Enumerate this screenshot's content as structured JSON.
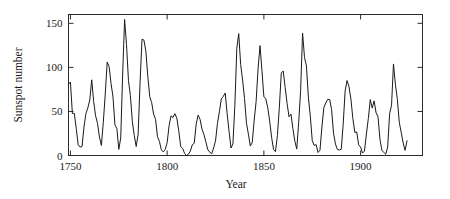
{
  "chart_data": {
    "type": "line",
    "title": "",
    "xlabel": "Year",
    "ylabel": "Sunspot number",
    "xlim": [
      1749,
      1932
    ],
    "ylim": [
      0,
      160
    ],
    "grid": false,
    "legend": null,
    "xticks": [
      1750,
      1800,
      1850,
      1900
    ],
    "xtick_labels": [
      "1750",
      "1800",
      "1850",
      "1900"
    ],
    "yticks": [
      0,
      50,
      100,
      150
    ],
    "ytick_labels": [
      "0",
      "50",
      "100",
      "150"
    ],
    "tick_direction": "in",
    "box": true,
    "line_color": "#1a1a1a",
    "background": "#ffffff",
    "series": [
      {
        "name": "Annual sunspot number",
        "x": [
          1749,
          1750,
          1751,
          1752,
          1753,
          1754,
          1755,
          1756,
          1757,
          1758,
          1759,
          1760,
          1761,
          1762,
          1763,
          1764,
          1765,
          1766,
          1767,
          1768,
          1769,
          1770,
          1771,
          1772,
          1773,
          1774,
          1775,
          1776,
          1777,
          1778,
          1779,
          1780,
          1781,
          1782,
          1783,
          1784,
          1785,
          1786,
          1787,
          1788,
          1789,
          1790,
          1791,
          1792,
          1793,
          1794,
          1795,
          1796,
          1797,
          1798,
          1799,
          1800,
          1801,
          1802,
          1803,
          1804,
          1805,
          1806,
          1807,
          1808,
          1809,
          1810,
          1811,
          1812,
          1813,
          1814,
          1815,
          1816,
          1817,
          1818,
          1819,
          1820,
          1821,
          1822,
          1823,
          1824,
          1825,
          1826,
          1827,
          1828,
          1829,
          1830,
          1831,
          1832,
          1833,
          1834,
          1835,
          1836,
          1837,
          1838,
          1839,
          1840,
          1841,
          1842,
          1843,
          1844,
          1845,
          1846,
          1847,
          1848,
          1849,
          1850,
          1851,
          1852,
          1853,
          1854,
          1855,
          1856,
          1857,
          1858,
          1859,
          1860,
          1861,
          1862,
          1863,
          1864,
          1865,
          1866,
          1867,
          1868,
          1869,
          1870,
          1871,
          1872,
          1873,
          1874,
          1875,
          1876,
          1877,
          1878,
          1879,
          1880,
          1881,
          1882,
          1883,
          1884,
          1885,
          1886,
          1887,
          1888,
          1889,
          1890,
          1891,
          1892,
          1893,
          1894,
          1895,
          1896,
          1897,
          1898,
          1899,
          1900,
          1901,
          1902,
          1903,
          1904,
          1905,
          1906,
          1907,
          1908,
          1909,
          1910,
          1911,
          1912,
          1913,
          1914,
          1915,
          1916,
          1917,
          1918,
          1919,
          1920,
          1921,
          1922,
          1923,
          1924
        ],
        "values": [
          80.9,
          83.4,
          47.7,
          47.8,
          30.7,
          12.2,
          9.6,
          10.2,
          32.4,
          47.6,
          54.0,
          62.9,
          85.9,
          61.2,
          45.1,
          36.4,
          20.9,
          11.4,
          37.8,
          69.8,
          106.1,
          100.8,
          81.6,
          66.5,
          34.8,
          30.6,
          7.0,
          19.8,
          92.5,
          154.4,
          125.9,
          84.8,
          68.1,
          38.5,
          22.8,
          10.2,
          24.1,
          82.9,
          132.0,
          130.9,
          118.1,
          89.9,
          66.6,
          60.0,
          46.9,
          41.0,
          21.3,
          16.0,
          6.4,
          4.1,
          6.8,
          14.5,
          34.0,
          45.0,
          43.1,
          47.5,
          42.2,
          28.1,
          10.1,
          8.1,
          2.5,
          0.0,
          1.4,
          5.0,
          12.2,
          13.9,
          35.4,
          45.8,
          41.1,
          30.1,
          23.9,
          15.6,
          6.6,
          4.0,
          1.8,
          8.5,
          16.6,
          36.3,
          49.6,
          64.2,
          67.0,
          70.9,
          47.8,
          27.5,
          8.5,
          13.2,
          56.9,
          121.5,
          138.3,
          103.2,
          85.7,
          64.6,
          36.7,
          24.2,
          10.7,
          15.0,
          40.1,
          61.5,
          98.5,
          124.7,
          96.3,
          66.6,
          64.5,
          54.1,
          39.0,
          20.6,
          6.7,
          4.3,
          22.7,
          54.8,
          93.8,
          95.8,
          77.2,
          59.1,
          44.0,
          47.0,
          30.5,
          16.3,
          7.3,
          37.6,
          74.0,
          139.0,
          111.2,
          101.6,
          66.2,
          44.7,
          17.0,
          11.3,
          12.4,
          3.4,
          6.0,
          32.3,
          54.3,
          59.7,
          63.7,
          63.5,
          52.2,
          25.4,
          13.1,
          6.8,
          6.3,
          7.1,
          35.6,
          73.0,
          85.1,
          78.0,
          64.0,
          41.8,
          26.2,
          26.7,
          12.1,
          9.5,
          2.7,
          5.0,
          24.4,
          42.0,
          63.5,
          53.8,
          62.0,
          48.5,
          43.9,
          18.6,
          5.7,
          3.6,
          1.4,
          9.6,
          47.4,
          57.1,
          103.9,
          80.6,
          63.6,
          37.6,
          26.1,
          14.2,
          5.8,
          16.7
        ]
      }
    ]
  },
  "axes": {
    "y_title": "Sunspot number",
    "x_title": "Year"
  }
}
